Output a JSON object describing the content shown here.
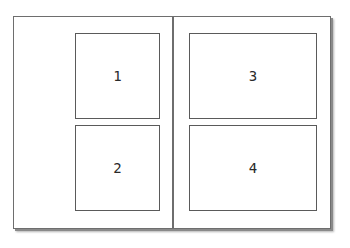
{
  "diagram": {
    "pages": [
      {
        "side": "left",
        "boxes": [
          {
            "id": "1",
            "label": "1"
          },
          {
            "id": "2",
            "label": "2"
          }
        ]
      },
      {
        "side": "right",
        "boxes": [
          {
            "id": "3",
            "label": "3"
          },
          {
            "id": "4",
            "label": "4"
          }
        ]
      }
    ],
    "colors": {
      "frame_border": "#6e6e6e",
      "box_border": "#5a5a5a",
      "label_text": "#2a2a2a",
      "background": "#ffffff"
    }
  }
}
